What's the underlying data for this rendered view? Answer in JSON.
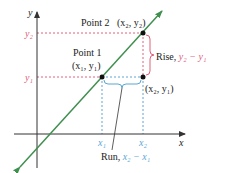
{
  "diagram": {
    "type": "slope-rise-run",
    "colors": {
      "axis": "#333333",
      "line": "#3f8f4f",
      "rise": "#e0607a",
      "run": "#5aa7d6",
      "point": "#111111",
      "text": "#222222"
    },
    "axes": {
      "x_label": "x",
      "y_label": "y",
      "origin_px": [
        37,
        134
      ]
    },
    "points": [
      {
        "id": "point1",
        "label": "Point 1",
        "coords_label": "(x₁, y₁)",
        "px": [
          102,
          77
        ]
      },
      {
        "id": "point2",
        "label": "Point 2",
        "coords_label": "(x₂, y₂)",
        "px": [
          143,
          33
        ]
      },
      {
        "id": "corner",
        "label": "",
        "coords_label": "(x₂, y₁)",
        "px": [
          143,
          77
        ]
      }
    ],
    "ticks": {
      "y": [
        {
          "label": "y₂",
          "px_y": 33
        },
        {
          "label": "y₁",
          "px_y": 77
        }
      ],
      "x": [
        {
          "label": "x₁",
          "px_x": 102
        },
        {
          "label": "x₂",
          "px_x": 143
        }
      ]
    },
    "rise": {
      "prefix": "Rise, ",
      "expr": "y₂ − y₁"
    },
    "run": {
      "prefix": "Run, ",
      "expr": "x₂ − x₁"
    },
    "labels": {
      "point1_title": "Point 1",
      "point1_coords": "(x₁, y₁)",
      "point2_title": "Point 2",
      "point2_coords": "(x₂, y₂)",
      "corner_coords": "(x₂, y₁)",
      "x_axis": "x",
      "y_axis": "y",
      "tick_y2": "y₂",
      "tick_y1": "y₁",
      "tick_x1": "x₁",
      "tick_x2": "x₂",
      "rise_prefix": "Rise, ",
      "rise_expr": "y₂ − y₁",
      "run_prefix": "Run, ",
      "run_expr": "x₂ − x₁"
    }
  }
}
